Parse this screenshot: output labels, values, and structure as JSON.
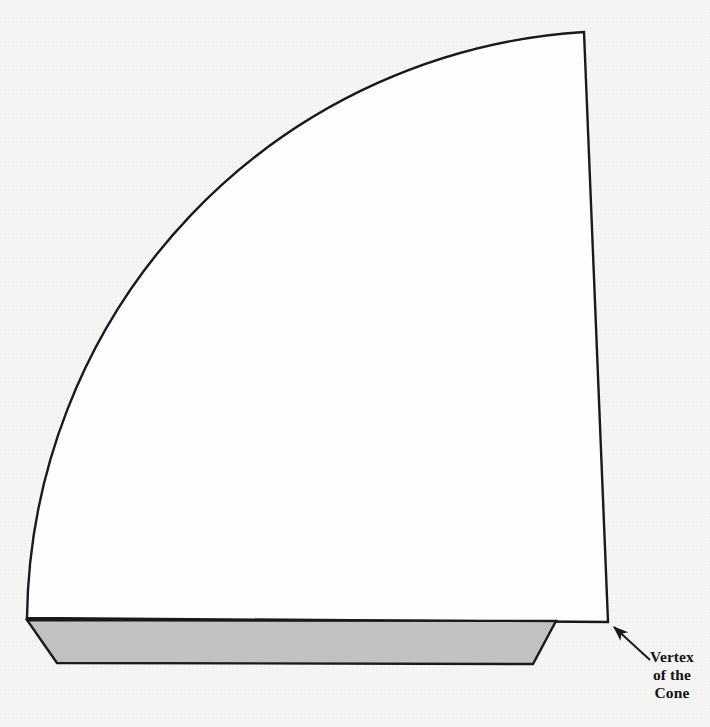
{
  "figure": {
    "background_color": "#f5f5f4",
    "stroke_color": "#1a1a1a",
    "sector": {
      "name": "lateral-surface-sector",
      "fill_color": "#ffffff",
      "stroke_color": "#1a1a1a",
      "stroke_width": 2.4,
      "vertex": {
        "x": 608,
        "y": 622
      },
      "radius": 594,
      "start_point": {
        "x": 27,
        "y": 618
      },
      "end_point": {
        "x": 584,
        "y": 32
      },
      "arc_sweep_degrees": 88
    },
    "base_strip": {
      "name": "cone-base-parallelogram",
      "fill_color": "#c2c2c2",
      "stroke_color": "#1a1a1a",
      "stroke_width": 2.4,
      "points": [
        {
          "x": 27,
          "y": 620
        },
        {
          "x": 556,
          "y": 621
        },
        {
          "x": 533,
          "y": 664
        },
        {
          "x": 57,
          "y": 663
        }
      ]
    },
    "leader_arrow": {
      "name": "vertex-leader-arrow",
      "stroke_color": "#1a1a1a",
      "stroke_width": 2.0,
      "tail": {
        "x": 650,
        "y": 660
      },
      "head": {
        "x": 612,
        "y": 625
      }
    },
    "annotation": {
      "name": "vertex-of-the-cone-label",
      "lines": [
        "Vertex",
        "of the",
        "Cone"
      ],
      "line1": "Vertex",
      "line2": "of the",
      "line3": "Cone",
      "color": "#141414",
      "font_weight": "bold",
      "font_size_px": 15.5
    }
  }
}
